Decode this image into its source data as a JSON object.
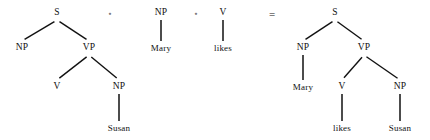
{
  "figure": {
    "kind": "syntax-tree-composition-equation",
    "background_color": "#ffffff",
    "ink_color": "#111111",
    "width": 430,
    "height": 140
  },
  "operators": {
    "compose_symbol": "∘",
    "equals_symbol": "=",
    "compose_1": {
      "x": 110,
      "y": 14
    },
    "compose_2": {
      "x": 196,
      "y": 14
    },
    "equals": {
      "x": 272,
      "y": 14
    }
  },
  "trees": [
    {
      "id": "tree-left-skeleton",
      "nodes": [
        {
          "id": "t1-s",
          "label": "S",
          "x": 57,
          "y": 13,
          "type": "nonterminal"
        },
        {
          "id": "t1-np1",
          "label": "NP",
          "x": 22,
          "y": 48,
          "type": "nonterminal"
        },
        {
          "id": "t1-vp",
          "label": "VP",
          "x": 89,
          "y": 48,
          "type": "nonterminal"
        },
        {
          "id": "t1-v",
          "label": "V",
          "x": 57,
          "y": 87,
          "type": "nonterminal"
        },
        {
          "id": "t1-np2",
          "label": "NP",
          "x": 119,
          "y": 87,
          "type": "nonterminal"
        },
        {
          "id": "t1-susan",
          "label": "Susan",
          "x": 119,
          "y": 128,
          "type": "terminal"
        }
      ],
      "edges": [
        {
          "from": "t1-s",
          "to": "t1-np1"
        },
        {
          "from": "t1-s",
          "to": "t1-vp"
        },
        {
          "from": "t1-vp",
          "to": "t1-v"
        },
        {
          "from": "t1-vp",
          "to": "t1-np2"
        },
        {
          "from": "t1-np2",
          "to": "t1-susan"
        }
      ]
    },
    {
      "id": "tree-mary",
      "nodes": [
        {
          "id": "t2-np",
          "label": "NP",
          "x": 161,
          "y": 13,
          "type": "nonterminal"
        },
        {
          "id": "t2-mary",
          "label": "Mary",
          "x": 161,
          "y": 48,
          "type": "terminal"
        }
      ],
      "edges": [
        {
          "from": "t2-np",
          "to": "t2-mary"
        }
      ]
    },
    {
      "id": "tree-likes",
      "nodes": [
        {
          "id": "t3-v",
          "label": "V",
          "x": 223,
          "y": 13,
          "type": "nonterminal"
        },
        {
          "id": "t3-likes",
          "label": "likes",
          "x": 223,
          "y": 48,
          "type": "terminal"
        }
      ],
      "edges": [
        {
          "from": "t3-v",
          "to": "t3-likes"
        }
      ]
    },
    {
      "id": "tree-right-result",
      "nodes": [
        {
          "id": "t4-s",
          "label": "S",
          "x": 335,
          "y": 13,
          "type": "nonterminal"
        },
        {
          "id": "t4-np1",
          "label": "NP",
          "x": 303,
          "y": 48,
          "type": "nonterminal"
        },
        {
          "id": "t4-vp",
          "label": "VP",
          "x": 364,
          "y": 48,
          "type": "nonterminal"
        },
        {
          "id": "t4-mary",
          "label": "Mary",
          "x": 303,
          "y": 87,
          "type": "terminal"
        },
        {
          "id": "t4-v",
          "label": "V",
          "x": 342,
          "y": 87,
          "type": "nonterminal"
        },
        {
          "id": "t4-np2",
          "label": "NP",
          "x": 400,
          "y": 87,
          "type": "nonterminal"
        },
        {
          "id": "t4-likes",
          "label": "likes",
          "x": 342,
          "y": 128,
          "type": "terminal"
        },
        {
          "id": "t4-susan",
          "label": "Susan",
          "x": 400,
          "y": 128,
          "type": "terminal"
        }
      ],
      "edges": [
        {
          "from": "t4-s",
          "to": "t4-np1"
        },
        {
          "from": "t4-s",
          "to": "t4-vp"
        },
        {
          "from": "t4-np1",
          "to": "t4-mary"
        },
        {
          "from": "t4-vp",
          "to": "t4-v"
        },
        {
          "from": "t4-vp",
          "to": "t4-np2"
        },
        {
          "from": "t4-v",
          "to": "t4-likes"
        },
        {
          "from": "t4-np2",
          "to": "t4-susan"
        }
      ]
    }
  ]
}
